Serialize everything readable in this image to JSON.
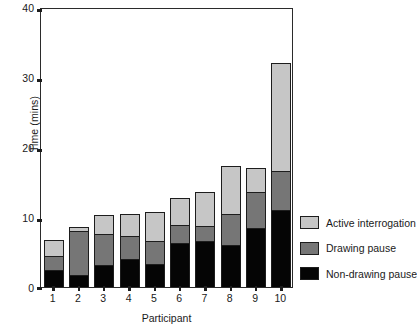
{
  "chart_data": {
    "type": "bar",
    "subtype": "stacked-bar",
    "title": "",
    "xlabel": "Participant",
    "ylabel": "Time (mins)",
    "ylim": [
      0,
      40
    ],
    "yticks": [
      0,
      10,
      20,
      30,
      40
    ],
    "grid": false,
    "legend_position": "right",
    "categories": [
      "1",
      "2",
      "3",
      "4",
      "5",
      "6",
      "7",
      "8",
      "9",
      "10"
    ],
    "series": [
      {
        "name": "Non-drawing pause",
        "color": "#050505",
        "values": [
          2.3,
          1.6,
          3.0,
          3.9,
          3.1,
          6.1,
          6.4,
          5.9,
          8.3,
          10.9
        ]
      },
      {
        "name": "Drawing pause",
        "color": "#767676",
        "values": [
          2.0,
          6.2,
          4.4,
          3.2,
          3.3,
          2.6,
          2.2,
          4.4,
          5.2,
          5.6
        ]
      },
      {
        "name": "Active interrogation",
        "color": "#c6c6c6",
        "values": [
          2.4,
          0.8,
          2.9,
          3.3,
          4.3,
          4.0,
          5.0,
          7.0,
          3.5,
          15.5
        ]
      }
    ],
    "totals": [
      6.7,
      8.6,
      10.3,
      10.4,
      10.7,
      12.7,
      13.6,
      17.3,
      17.0,
      32.0
    ]
  },
  "legend": {
    "items": [
      {
        "label": "Active interrogation",
        "color": "#c6c6c6"
      },
      {
        "label": "Drawing pause",
        "color": "#767676"
      },
      {
        "label": "Non-drawing pause",
        "color": "#050505"
      }
    ]
  }
}
